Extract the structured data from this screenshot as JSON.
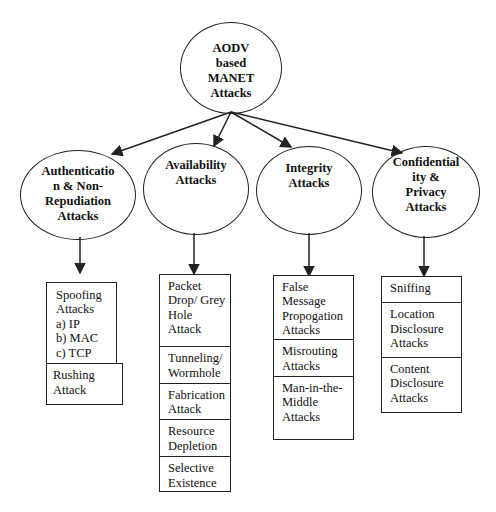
{
  "root": {
    "lines": [
      "AODV",
      "based",
      "MANET",
      "Attacks"
    ]
  },
  "categories": [
    {
      "id": "auth",
      "lines": [
        "Authenticatio",
        "n & Non-",
        "Repudiation",
        "Attacks"
      ],
      "items": [
        {
          "lines": [
            "Spoofing",
            "Attacks",
            "a) IP",
            "b) MAC",
            "c) TCP"
          ]
        },
        {
          "lines": [
            "Rushing",
            "Attack"
          ]
        }
      ]
    },
    {
      "id": "avail",
      "lines": [
        "Availability",
        "Attacks"
      ],
      "items": [
        {
          "lines": [
            "Packet",
            "Drop/ Grey",
            "Hole",
            "Attack"
          ]
        },
        {
          "lines": [
            "Tunneling/",
            "Wormhole"
          ]
        },
        {
          "lines": [
            "Fabrication",
            "Attack"
          ]
        },
        {
          "lines": [
            "Resource",
            "Depletion"
          ]
        },
        {
          "lines": [
            "Selective",
            "Existence"
          ]
        }
      ]
    },
    {
      "id": "integ",
      "lines": [
        "Integrity",
        "Attacks"
      ],
      "items": [
        {
          "lines": [
            "False",
            "Message",
            "Propogation",
            "Attacks"
          ]
        },
        {
          "lines": [
            "Misrouting",
            "Attacks"
          ]
        },
        {
          "lines": [
            "Man-in-the-",
            "Middle",
            "Attacks"
          ]
        }
      ]
    },
    {
      "id": "conf",
      "lines": [
        "Confidential",
        "ity &",
        "Privacy",
        "Attacks"
      ],
      "items": [
        {
          "lines": [
            "Sniffing"
          ]
        },
        {
          "lines": [
            "Location",
            "Disclosure",
            "Attacks"
          ]
        },
        {
          "lines": [
            "Content",
            "Disclosure",
            "Attacks"
          ]
        }
      ]
    }
  ]
}
